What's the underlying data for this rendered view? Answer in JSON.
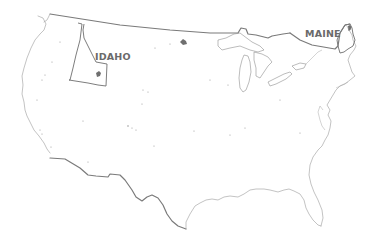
{
  "map": {
    "subject": "Contiguous United States outline",
    "highlighted_states": [
      {
        "name": "IDAHO",
        "label": "IDAHO",
        "label_x": 95,
        "label_y": 60
      },
      {
        "name": "MAINE",
        "label": "MAINE",
        "label_x": 305,
        "label_y": 37
      }
    ],
    "colors": {
      "background": "#ffffff",
      "outline": "#9a9a9a",
      "border": "#7a7a7a",
      "label": "#6a6a6a"
    }
  }
}
